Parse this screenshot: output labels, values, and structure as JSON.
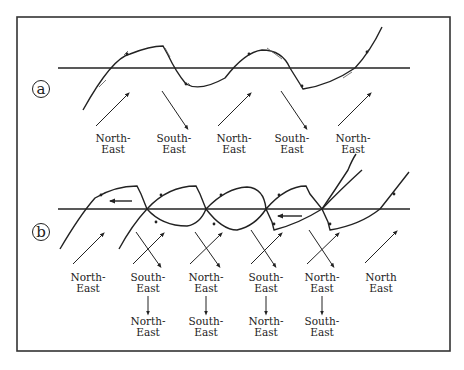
{
  "figure": {
    "frame": {
      "x": 17,
      "y": 17,
      "width": 433,
      "height": 334,
      "stroke": "#333333"
    },
    "ink_color": "#222222"
  },
  "panels": [
    {
      "id": "a",
      "letter": "a",
      "baseline_y": 68,
      "wind_labels": [
        {
          "line1": "North-",
          "line2": "East"
        },
        {
          "line1": "South-",
          "line2": "East"
        },
        {
          "line1": "North-",
          "line2": "East"
        },
        {
          "line1": "South-",
          "line2": "East"
        },
        {
          "line1": "North-",
          "line2": "East"
        }
      ]
    },
    {
      "id": "b",
      "letter": "b",
      "baseline_y": 209,
      "wind_labels": [
        {
          "line1": "North-",
          "line2": "East"
        },
        {
          "line1": "South-",
          "line2": "East"
        },
        {
          "line1": "North-",
          "line2": "East"
        },
        {
          "line1": "South-",
          "line2": "East"
        },
        {
          "line1": "North-",
          "line2": "East"
        },
        {
          "line1": "North",
          "line2": "East"
        }
      ],
      "resulting_labels": [
        {
          "line1": "North-",
          "line2": "East"
        },
        {
          "line1": "South-",
          "line2": "East"
        },
        {
          "line1": "North-",
          "line2": "East"
        },
        {
          "line1": "South-",
          "line2": "East"
        }
      ]
    }
  ]
}
